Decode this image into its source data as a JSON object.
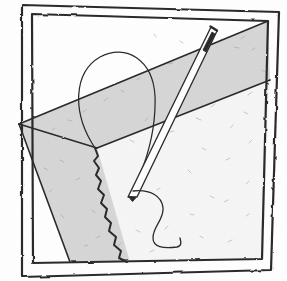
{
  "artwork": {
    "title": "Needle and thread piercing folded fabric",
    "medium": "pen-and-ink line drawing",
    "caption": "",
    "canvas": {
      "width": 287,
      "height": 281,
      "background": "#ffffff"
    },
    "palette": {
      "ink": "#2b2b2b",
      "ink_light": "#555555",
      "paper": "#ffffff",
      "fabric_gray": "#d6d6d6",
      "fabric_gray_dark": "#c9c9c9",
      "fabric_white": "#f6f6f6",
      "frame_line": "#3a3a3a",
      "speckle": "#9b9b9b"
    },
    "frame": {
      "name": "double-line-border",
      "outer_points": "22,5 279,12 271,270 22,277",
      "inner_points": "32,14 268,21 262,259 33,263",
      "stroke_width": 2.2
    },
    "shapes": [
      {
        "name": "fabric-band",
        "kind": "quadrilateral",
        "fill": "#d6d6d6",
        "points": "19,124 268,21 270,80 97,148"
      },
      {
        "name": "fabric-lower-left-panel",
        "kind": "polygon",
        "fill": "#d6d6d6",
        "points": "19,124 97,148 130,262 70,262"
      },
      {
        "name": "fabric-right-panel",
        "kind": "polygon",
        "fill": "#f6f6f6",
        "points": "97,148 270,80 262,259 130,262"
      },
      {
        "name": "dome-oval",
        "kind": "arch",
        "fill": "none",
        "path": "M 95,148 C 71,112 74,72 100,57 C 126,43 153,60 155,96 C 156,124 150,150 140,175"
      },
      {
        "name": "torn-edge",
        "kind": "jagged-line",
        "path": "M 95,148 L 98,156 L 94,161 L 99,168 L 96,175 L 101,181 L 98,189 L 104,195 L 101,203 L 107,209 L 105,217 L 111,223 L 109,231 L 116,237 L 114,245 L 121,251 L 119,258 L 127,262"
      }
    ],
    "needle": {
      "name": "sewing-needle",
      "eye_point": [
        213,
        28
      ],
      "tip_point": [
        131,
        196
      ],
      "outline_path": "M 211,27 L 217,31 L 137,197 L 128,197 Z",
      "eye_slot_path": "M 212,32 L 215,34 L 206,52 L 203,50 Z",
      "shaft_center": "M 214,30 L 132,196"
    },
    "thread": {
      "name": "thread-curve",
      "path": "M 133,191 C 150,189 162,196 163,208 C 164,220 153,226 153,238 C 153,247 163,249 177,247 C 182,246 181,242 180,238"
    },
    "speckles": [
      [
        210,
        45
      ],
      [
        222,
        39
      ],
      [
        234,
        47
      ],
      [
        245,
        36
      ],
      [
        252,
        50
      ],
      [
        196,
        57
      ],
      [
        183,
        43
      ],
      [
        168,
        64
      ],
      [
        154,
        34
      ],
      [
        140,
        78
      ],
      [
        121,
        90
      ],
      [
        104,
        101
      ],
      [
        86,
        110
      ],
      [
        68,
        120
      ],
      [
        52,
        130
      ],
      [
        196,
        118
      ],
      [
        215,
        104
      ],
      [
        230,
        128
      ],
      [
        244,
        112
      ],
      [
        252,
        140
      ],
      [
        226,
        160
      ],
      [
        206,
        150
      ],
      [
        188,
        170
      ],
      [
        170,
        132
      ],
      [
        160,
        188
      ],
      [
        210,
        196
      ],
      [
        228,
        200
      ],
      [
        246,
        184
      ],
      [
        190,
        214
      ],
      [
        168,
        226
      ],
      [
        150,
        252
      ],
      [
        200,
        236
      ],
      [
        232,
        240
      ],
      [
        246,
        216
      ],
      [
        60,
        160
      ],
      [
        52,
        190
      ],
      [
        76,
        180
      ],
      [
        92,
        210
      ],
      [
        100,
        236
      ],
      [
        84,
        246
      ],
      [
        64,
        218
      ],
      [
        44,
        168
      ],
      [
        118,
        246
      ],
      [
        136,
        230
      ],
      [
        252,
        92
      ],
      [
        262,
        70
      ],
      [
        178,
        96
      ],
      [
        148,
        118
      ],
      [
        130,
        140
      ]
    ]
  }
}
